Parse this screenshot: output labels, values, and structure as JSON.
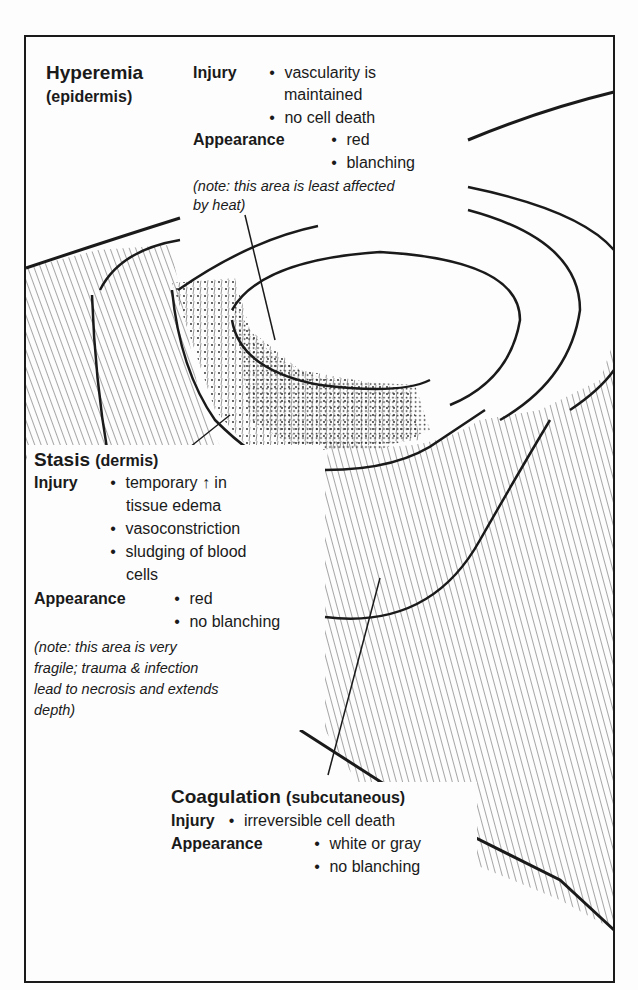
{
  "diagram": {
    "frame_color": "#1a1a1a",
    "zones": [
      {
        "name": "Hyperemia",
        "layer": "(epidermis)",
        "injury_label": "Injury",
        "injury": [
          "vascularity is",
          "maintained",
          "no cell death"
        ],
        "appearance_label": "Appearance",
        "appearance": [
          "red",
          "blanching"
        ],
        "note": [
          "(note: this area is least affected",
          "by heat)"
        ]
      },
      {
        "name": "Stasis",
        "layer": "(dermis)",
        "injury_label": "Injury",
        "injury": [
          "temporary ↑ in",
          "tissue edema",
          "vasoconstriction",
          "sludging of blood",
          "cells"
        ],
        "appearance_label": "Appearance",
        "appearance": [
          "red",
          "no blanching"
        ],
        "note": [
          "(note: this area is very",
          "fragile; trauma & infection",
          "lead to necrosis and extends",
          "depth)"
        ]
      },
      {
        "name": "Coagulation",
        "layer": "(subcutaneous)",
        "injury_label": "Injury",
        "injury": [
          "irreversible cell death"
        ],
        "appearance_label": "Appearance",
        "appearance": [
          "white or gray",
          "no blanching"
        ]
      }
    ],
    "bullet": "•"
  }
}
